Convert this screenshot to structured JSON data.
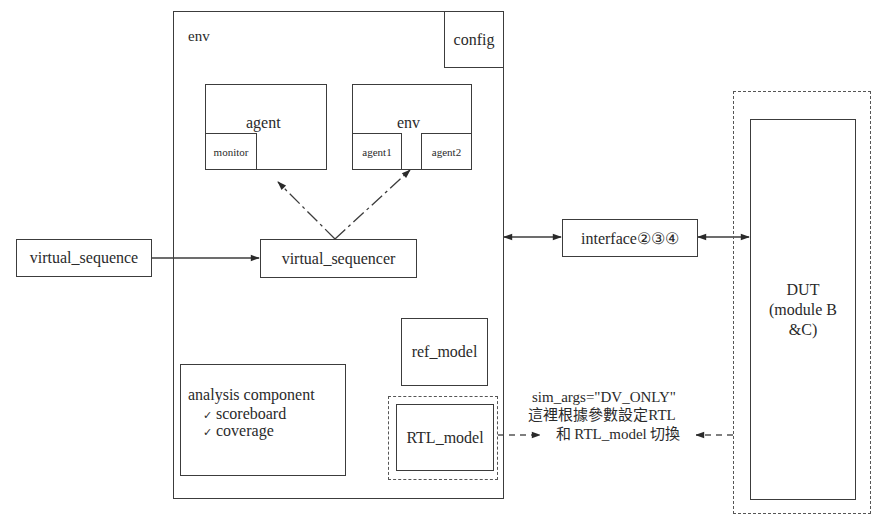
{
  "diagram": {
    "outer_env": {
      "label": "env"
    },
    "config": {
      "label": "config"
    },
    "agent": {
      "label": "agent",
      "sub": {
        "monitor": "monitor"
      }
    },
    "inner_env": {
      "label": "env",
      "sub": {
        "agent1": "agent1",
        "agent2": "agent2"
      }
    },
    "virtual_sequence": {
      "label": "virtual_sequence"
    },
    "virtual_sequencer": {
      "label": "virtual_sequencer"
    },
    "interface": {
      "label": "interface②③④"
    },
    "dut": {
      "line1": "DUT",
      "line2": "(module B",
      "line3": "&C)"
    },
    "ref_model": {
      "label": "ref_model"
    },
    "rtl_model": {
      "label": "RTL_model"
    },
    "analysis": {
      "title": "analysis component",
      "items": [
        {
          "check": "✓",
          "label": "scoreboard"
        },
        {
          "check": "✓",
          "label": "coverage"
        }
      ]
    },
    "annotation": {
      "line1": "sim_args=\"DV_ONLY\"",
      "line2": "這裡根據參數設定RTL",
      "line3": "和 RTL_model 切換"
    }
  },
  "colors": {
    "line": "#3c3c3c",
    "dashed": "#555555",
    "text": "#2a2a2a",
    "background": "#ffffff"
  }
}
